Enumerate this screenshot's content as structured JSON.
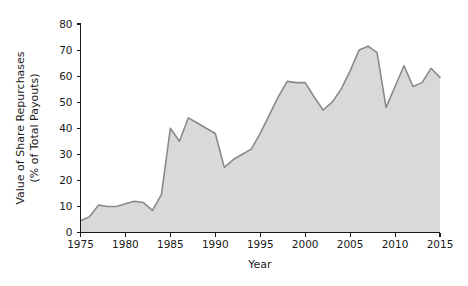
{
  "chart_data": {
    "type": "area",
    "title": "",
    "xlabel": "Year",
    "ylabel": "Value of Share Repurchases (% of Total Payouts)",
    "ylabel_line1": "Value of Share Repurchases",
    "ylabel_line2": "(% of Total Payouts)",
    "xlim": [
      1975,
      2015
    ],
    "ylim": [
      0,
      80
    ],
    "xticks": [
      1975,
      1980,
      1985,
      1990,
      1995,
      2000,
      2005,
      2010,
      2015
    ],
    "xtick_labels": [
      "1975",
      "1980",
      "1985",
      "1990",
      "1995",
      "2000",
      "2005",
      "2010",
      "2015"
    ],
    "yticks": [
      0,
      10,
      20,
      30,
      40,
      50,
      60,
      70,
      80
    ],
    "ytick_labels": [
      "0",
      "10",
      "20",
      "30",
      "40",
      "50",
      "60",
      "70",
      "80"
    ],
    "grid": false,
    "legend": false,
    "fill_color": "#d9d9d9",
    "line_color": "#8a8a8a",
    "axis_color": "#1a1a1a",
    "background_color": "#ffffff",
    "x": [
      1975,
      1976,
      1977,
      1978,
      1979,
      1980,
      1981,
      1982,
      1983,
      1984,
      1985,
      1986,
      1987,
      1988,
      1989,
      1990,
      1991,
      1992,
      1993,
      1994,
      1995,
      1996,
      1997,
      1998,
      1999,
      2000,
      2001,
      2002,
      2003,
      2004,
      2005,
      2006,
      2007,
      2008,
      2009,
      2010,
      2011,
      2012,
      2013,
      2014,
      2015
    ],
    "values": [
      4.5,
      6.0,
      10.5,
      10.0,
      10.0,
      11.0,
      12.0,
      11.5,
      8.5,
      14.5,
      40.0,
      35.0,
      44.0,
      42.0,
      40.0,
      38.0,
      25.0,
      28.0,
      30.0,
      32.0,
      38.0,
      45.0,
      52.0,
      58.0,
      57.5,
      57.5,
      52.0,
      47.0,
      50.0,
      55.0,
      62.0,
      70.0,
      71.5,
      69.0,
      48.0,
      56.0,
      64.0,
      56.0,
      57.5,
      63.0,
      59.5
    ],
    "series_name": "Value of Share Repurchases"
  },
  "figure": {
    "name": "share-repurchases-area-chart"
  }
}
